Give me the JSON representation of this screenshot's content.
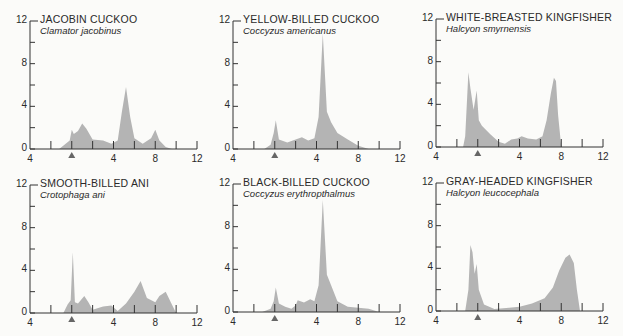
{
  "figure": {
    "y_ticks": [
      "12",
      "8",
      "4",
      "0"
    ],
    "x_tick_labels": [
      "4",
      "4",
      "8",
      "12"
    ],
    "marker": "triangle-marker",
    "colors": {
      "fill": "#b4b4b4",
      "axis": "#333333",
      "text": "#2a2a2a"
    }
  },
  "panels": [
    {
      "common": "JACOBIN CUCKOO",
      "scientific": "Clamator jacobinus"
    },
    {
      "common": "YELLOW-BILLED CUCKOO",
      "scientific": "Coccyzus americanus"
    },
    {
      "common": "WHITE-BREASTED KINGFISHER",
      "scientific": "Halcyon smyrnensis"
    },
    {
      "common": "SMOOTH-BILLED ANI",
      "scientific": "Crotophaga ani"
    },
    {
      "common": "BLACK-BILLED CUCKOO",
      "scientific": "Coccyzus erythropthalmus"
    },
    {
      "common": "GRAY-HEADED KINGFISHER",
      "scientific": "Halcyon leucocephala"
    }
  ],
  "chart_data": [
    {
      "type": "area",
      "title": "JACOBIN CUCKOO — Clamator jacobinus",
      "xlabel": "",
      "ylabel": "",
      "ylim": [
        0,
        12
      ],
      "x_tick_labels": [
        "4",
        "",
        "▲",
        "",
        "4",
        "",
        "8",
        "",
        "12"
      ],
      "x": [
        1.4,
        1.9,
        2.0,
        2.1,
        2.3,
        2.5,
        2.7,
        3.0,
        3.5,
        3.9,
        4.2,
        4.4,
        4.6,
        4.8,
        5.0,
        5.4,
        5.8,
        6.0,
        6.2,
        6.5,
        6.8
      ],
      "values": [
        0,
        0.8,
        1.8,
        1.4,
        1.7,
        2.4,
        1.9,
        0.9,
        0.8,
        0.5,
        0.8,
        3.5,
        5.8,
        3.0,
        1.0,
        0.5,
        1.0,
        1.8,
        0.8,
        0.2,
        0
      ]
    },
    {
      "type": "area",
      "title": "YELLOW-BILLED CUCKOO — Coccyzus americanus",
      "xlabel": "",
      "ylabel": "",
      "ylim": [
        0,
        12
      ],
      "x_tick_labels": [
        "4",
        "",
        "▲",
        "",
        "4",
        "",
        "8",
        "",
        "12"
      ],
      "x": [
        1.5,
        1.8,
        1.95,
        2.05,
        2.2,
        2.6,
        3.0,
        3.3,
        3.6,
        3.9,
        4.1,
        4.3,
        4.5,
        4.7,
        5.0,
        5.5,
        6.0,
        6.5
      ],
      "values": [
        0,
        0.4,
        1.5,
        2.7,
        0.9,
        0.6,
        0.9,
        1.1,
        0.8,
        1.0,
        3.0,
        10.8,
        3.5,
        2.5,
        1.5,
        0.9,
        0.3,
        0
      ],
      "note": "peak near ~11"
    },
    {
      "type": "area",
      "title": "WHITE-BREASTED KINGFISHER — Halcyon smyrnensis",
      "xlabel": "",
      "ylabel": "",
      "ylim": [
        0,
        12
      ],
      "x_tick_labels": [
        "4",
        "",
        "▲",
        "",
        "4",
        "",
        "8",
        "",
        "12"
      ],
      "x": [
        1.3,
        1.4,
        1.55,
        1.65,
        1.8,
        1.95,
        2.05,
        2.2,
        2.6,
        3.0,
        3.3,
        3.6,
        3.9,
        4.1,
        4.4,
        4.8,
        5.1,
        5.3,
        5.5,
        5.65,
        5.75,
        5.85,
        6.0
      ],
      "values": [
        0,
        1.0,
        7.0,
        5.5,
        3.5,
        5.3,
        2.5,
        2.0,
        1.2,
        0.5,
        0.3,
        0.7,
        0.8,
        1.0,
        0.8,
        0.7,
        1.0,
        2.5,
        5.0,
        6.5,
        6.2,
        3.0,
        0
      ]
    },
    {
      "type": "area",
      "title": "SMOOTH-BILLED ANI — Crotophaga ani",
      "xlabel": "",
      "ylabel": "",
      "ylim": [
        0,
        12
      ],
      "x_tick_labels": [
        "4",
        "",
        "▲",
        "",
        "4",
        "",
        "8",
        "",
        "12"
      ],
      "x": [
        1.6,
        1.8,
        1.95,
        2.05,
        2.15,
        2.3,
        2.6,
        2.8,
        3.0,
        3.5,
        3.9,
        4.2,
        4.6,
        5.0,
        5.3,
        5.6,
        6.0,
        6.2,
        6.5,
        6.8,
        7.0
      ],
      "values": [
        0,
        0.8,
        1.2,
        5.7,
        1.0,
        0.9,
        1.6,
        1.0,
        0.3,
        0.6,
        0.7,
        0.2,
        0.9,
        2.0,
        3.0,
        1.4,
        1.0,
        1.6,
        2.0,
        0.8,
        0
      ]
    },
    {
      "type": "area",
      "title": "BLACK-BILLED CUCKOO — Coccyzus erythropthalmus",
      "xlabel": "",
      "ylabel": "",
      "ylim": [
        0,
        12
      ],
      "x_tick_labels": [
        "4",
        "",
        "▲",
        "",
        "4",
        "",
        "8",
        "",
        "12"
      ],
      "x": [
        1.4,
        1.8,
        1.95,
        2.05,
        2.2,
        2.5,
        2.8,
        3.0,
        3.1,
        3.4,
        3.7,
        3.9,
        4.1,
        4.3,
        4.5,
        4.7,
        5.0,
        5.5,
        6.0,
        6.5,
        7.0
      ],
      "values": [
        0,
        0.3,
        1.0,
        2.3,
        0.8,
        0.5,
        0.3,
        0.6,
        1.1,
        0.9,
        1.2,
        1.0,
        2.5,
        10.5,
        3.5,
        2.5,
        1.0,
        0.5,
        0.4,
        0.3,
        0
      ]
    },
    {
      "type": "area",
      "title": "GRAY-HEADED KINGFISHER — Halcyon leucocephala",
      "xlabel": "",
      "ylabel": "",
      "ylim": [
        0,
        12
      ],
      "x_tick_labels": [
        "4",
        "",
        "▲",
        "",
        "4",
        "",
        "8",
        "",
        "12"
      ],
      "x": [
        1.4,
        1.55,
        1.65,
        1.75,
        1.85,
        1.95,
        2.05,
        2.3,
        2.8,
        3.5,
        4.0,
        4.6,
        5.2,
        5.6,
        5.9,
        6.2,
        6.4,
        6.6,
        6.75,
        6.9
      ],
      "values": [
        0,
        2.0,
        6.2,
        5.5,
        3.5,
        4.4,
        2.0,
        0.6,
        0.2,
        0.3,
        0.4,
        0.7,
        1.2,
        2.2,
        3.8,
        5.0,
        5.3,
        4.5,
        2.0,
        0
      ]
    }
  ]
}
